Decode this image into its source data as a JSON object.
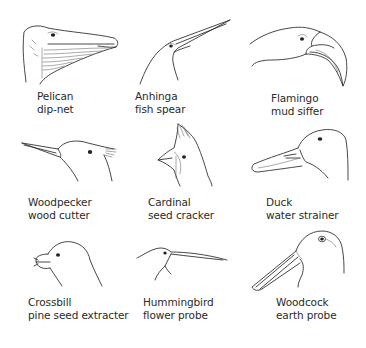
{
  "figure": {
    "type": "bird beak adaptations illustration",
    "layout": {
      "rows": 3,
      "columns": 3
    }
  },
  "birds": [
    {
      "name": "Pelican",
      "beak_function": "dip-net",
      "drawing_icon": "pelican-head-icon"
    },
    {
      "name": "Anhinga",
      "beak_function": "fish spear",
      "drawing_icon": "anhinga-head-icon"
    },
    {
      "name": "Flamingo",
      "beak_function": "mud siffer",
      "drawing_icon": "flamingo-head-icon"
    },
    {
      "name": "Woodpecker",
      "beak_function": "wood cutter",
      "drawing_icon": "woodpecker-head-icon"
    },
    {
      "name": "Cardinal",
      "beak_function": "seed cracker",
      "drawing_icon": "cardinal-head-icon"
    },
    {
      "name": "Duck",
      "beak_function": "water strainer",
      "drawing_icon": "duck-head-icon"
    },
    {
      "name": "Crossbill",
      "beak_function": "pine seed extracter",
      "drawing_icon": "crossbill-head-icon"
    },
    {
      "name": "Hummingbird",
      "beak_function": "flower probe",
      "drawing_icon": "hummingbird-head-icon"
    },
    {
      "name": "Woodcock",
      "beak_function": "earth probe",
      "drawing_icon": "woodcock-head-icon"
    }
  ],
  "colors": {
    "background": "#ffffff",
    "ink": "#2a2a2a"
  }
}
